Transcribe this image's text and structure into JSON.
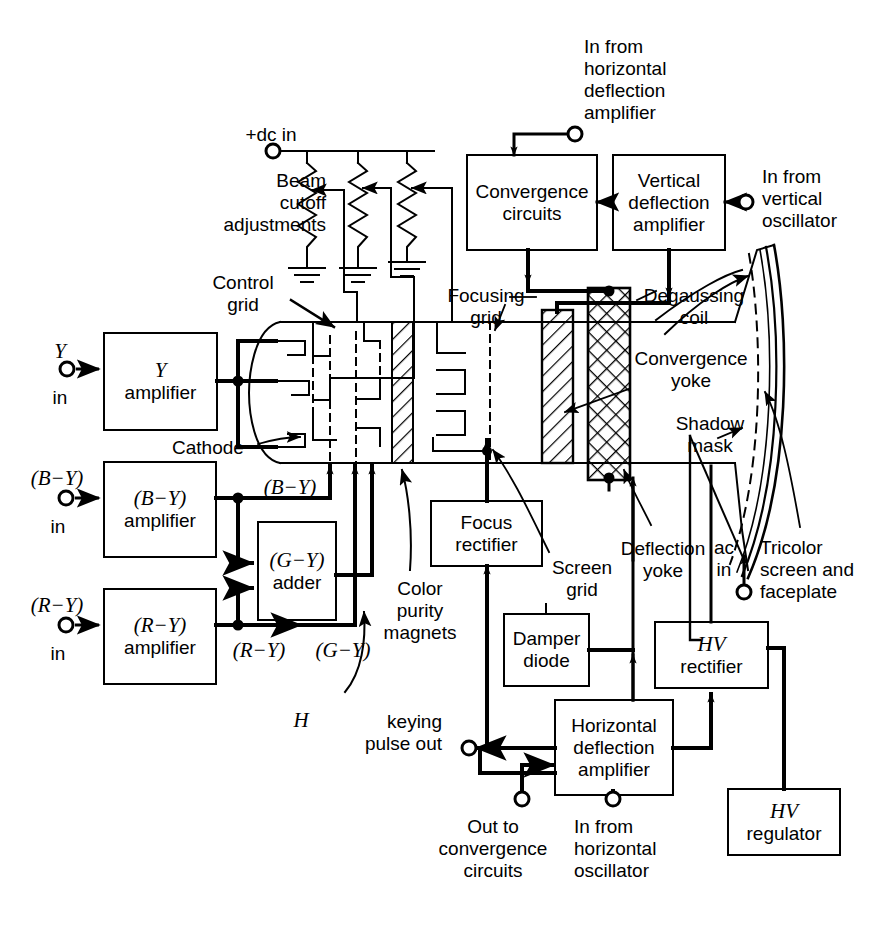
{
  "diagram": {
    "ink": "#000000",
    "paper": "#ffffff"
  },
  "boxes": [
    {
      "id": "y_amp",
      "name": "y-amplifier-box",
      "line1": "Y",
      "line2": "amplifier",
      "italic1": true,
      "x": 104,
      "y": 333,
      "w": 113,
      "h": 97
    },
    {
      "id": "by_amp",
      "name": "b-minus-y-amplifier-box",
      "line1": "(B−Y)",
      "line2": "amplifier",
      "italic1": true,
      "x": 104,
      "y": 462,
      "w": 112,
      "h": 95
    },
    {
      "id": "ry_amp",
      "name": "r-minus-y-amplifier-box",
      "line1": "(R−Y)",
      "line2": "amplifier",
      "italic1": true,
      "x": 104,
      "y": 589,
      "w": 112,
      "h": 95
    },
    {
      "id": "gy_adder",
      "name": "g-minus-y-adder-box",
      "line1": "(G−Y)",
      "line2": "adder",
      "italic1": true,
      "x": 258,
      "y": 522,
      "w": 78,
      "h": 98
    },
    {
      "id": "conv_circ",
      "name": "convergence-circuits-box",
      "line1": "Convergence",
      "line2": "circuits",
      "italic1": false,
      "x": 467,
      "y": 155,
      "w": 130,
      "h": 95
    },
    {
      "id": "vert_defl",
      "name": "vertical-deflection-amplifier-box",
      "line1": "Vertical",
      "line2": "deflection",
      "line3": "amplifier",
      "italic1": false,
      "x": 613,
      "y": 155,
      "w": 112,
      "h": 95
    },
    {
      "id": "focus_rect",
      "name": "focus-rectifier-box",
      "line1": "Focus",
      "line2": "rectifier",
      "italic1": false,
      "x": 431,
      "y": 501,
      "w": 111,
      "h": 65
    },
    {
      "id": "damper",
      "name": "damper-diode-box",
      "line1": "Damper",
      "line2": "diode",
      "italic1": false,
      "x": 504,
      "y": 614,
      "w": 85,
      "h": 72
    },
    {
      "id": "horiz_defl",
      "name": "horizontal-deflection-amplifier-box",
      "line1": "Horizontal",
      "line2": "deflection",
      "line3": "amplifier",
      "italic1": false,
      "x": 555,
      "y": 700,
      "w": 118,
      "h": 95
    },
    {
      "id": "hv_rect",
      "name": "hv-rectifier-box",
      "line1": "HV",
      "line2": "rectifier",
      "italic1": true,
      "x": 655,
      "y": 622,
      "w": 113,
      "h": 66
    },
    {
      "id": "hv_reg",
      "name": "hv-regulator-box",
      "line1": "HV",
      "line2": "regulator",
      "italic1": true,
      "x": 728,
      "y": 789,
      "w": 112,
      "h": 66
    }
  ],
  "labels": [
    {
      "id": "l_plusdc",
      "name": "plus-dc-in-label",
      "text": "+dc in",
      "x": 216,
      "y": 124,
      "w": 110,
      "align": "center"
    },
    {
      "id": "l_beamcut",
      "name": "beam-cutoff-adjustments-label",
      "text": "Beam\ncutoff\nadjustments",
      "x": 154,
      "y": 170,
      "w": 172,
      "align": "right"
    },
    {
      "id": "l_ctrlgrid",
      "name": "control-grid-label",
      "text": "Control\ngrid",
      "x": 200,
      "y": 272,
      "w": 86,
      "align": "center"
    },
    {
      "id": "l_cathode",
      "name": "cathode-label",
      "text": "Cathode",
      "x": 172,
      "y": 437,
      "w": 82,
      "align": "left"
    },
    {
      "id": "l_yin",
      "name": "y-in-terminal-label",
      "text": "Y",
      "x": 48,
      "y": 340,
      "w": 24,
      "align": "center",
      "italic": true
    },
    {
      "id": "l_yin2",
      "name": "y-in-label",
      "text": "in",
      "x": 48,
      "y": 387,
      "w": 24,
      "align": "center"
    },
    {
      "id": "l_byin",
      "name": "b-minus-y-in-terminal-label",
      "text": "(B−Y)",
      "x": 18,
      "y": 467,
      "w": 80,
      "align": "center",
      "italic": true
    },
    {
      "id": "l_byin2",
      "name": "b-minus-y-in-label",
      "text": "in",
      "x": 46,
      "y": 516,
      "w": 24,
      "align": "center"
    },
    {
      "id": "l_ryin",
      "name": "r-minus-y-in-terminal-label",
      "text": "(R−Y)",
      "x": 18,
      "y": 594,
      "w": 80,
      "align": "center",
      "italic": true
    },
    {
      "id": "l_ryin2",
      "name": "r-minus-y-in-label",
      "text": "in",
      "x": 46,
      "y": 643,
      "w": 24,
      "align": "center"
    },
    {
      "id": "l_bywire",
      "name": "b-minus-y-wire-label",
      "text": "(B−Y)",
      "x": 250,
      "y": 480,
      "w": 80,
      "align": "center",
      "italic": true
    },
    {
      "id": "l_rywire",
      "name": "r-minus-y-wire-label",
      "text": "(R−Y)",
      "x": 219,
      "y": 648,
      "w": 80,
      "align": "center",
      "italic": true
    },
    {
      "id": "l_gywire",
      "name": "g-minus-y-wire-label",
      "text": "(G−Y)",
      "x": 303,
      "y": 648,
      "w": 80,
      "align": "center",
      "italic": true
    },
    {
      "id": "l_colorpur",
      "name": "color-purity-magnets-label",
      "text": "Color\npurity\nmagnets",
      "x": 375,
      "y": 578,
      "w": 90,
      "align": "center"
    },
    {
      "id": "l_infromhoriz",
      "name": "in-from-horizontal-deflection-amplifier-label",
      "text": "In from\nhorizontal\ndeflection\namplifier",
      "x": 584,
      "y": 36,
      "w": 120,
      "align": "left"
    },
    {
      "id": "l_infromvert",
      "name": "in-from-vertical-oscillator-label",
      "text": "In from\nvertical\noscillator",
      "x": 762,
      "y": 166,
      "w": 124,
      "align": "left"
    },
    {
      "id": "l_focgrid",
      "name": "focusing-grid-label",
      "text": "Focusing\ngrid",
      "x": 440,
      "y": 285,
      "w": 90,
      "align": "center"
    },
    {
      "id": "l_degauss",
      "name": "degaussing-coil-label",
      "text": "Degaussing\ncoil",
      "x": 638,
      "y": 285,
      "w": 110,
      "align": "center"
    },
    {
      "id": "l_convyoke",
      "name": "convergence-yoke-label",
      "text": "Convergence\nyoke",
      "x": 629,
      "y": 348,
      "w": 122,
      "align": "center"
    },
    {
      "id": "l_shadow",
      "name": "shadow-mask-label",
      "text": "Shadow\nmask",
      "x": 662,
      "y": 413,
      "w": 96,
      "align": "center"
    },
    {
      "id": "l_tricolor",
      "name": "tricolor-screen-faceplate-label",
      "text": "Tricolor\nscreen and\nfaceplate",
      "x": 760,
      "y": 537,
      "w": 128,
      "align": "left"
    },
    {
      "id": "l_acin",
      "name": "ac-in-terminal-label",
      "text": "ac\nin",
      "x": 711,
      "y": 537,
      "w": 32,
      "align": "center"
    },
    {
      "id": "l_deflyoke",
      "name": "deflection-yoke-label",
      "text": "Deflection\nyoke",
      "x": 615,
      "y": 538,
      "w": 110,
      "align": "center"
    },
    {
      "id": "l_screengrid",
      "name": "screen-grid-label",
      "text": "Screen\ngrid",
      "x": 545,
      "y": 557,
      "w": 78,
      "align": "center"
    },
    {
      "id": "l_hkeying",
      "name": "h-keying-pulse-out-label",
      "text": "keying\npulse out",
      "x": 314,
      "y": 711,
      "w": 128,
      "align": "right"
    },
    {
      "id": "l_hkeying_h",
      "name": "h-keying-italic-h-label",
      "text": "H",
      "x": 292,
      "y": 710,
      "w": 22,
      "align": "center",
      "italic": true
    },
    {
      "id": "l_outtoconv",
      "name": "out-to-convergence-circuits-label",
      "text": "Out to\nconvergence\ncircuits",
      "x": 431,
      "y": 816,
      "w": 124,
      "align": "center"
    },
    {
      "id": "l_infromhosc",
      "name": "in-from-horizontal-oscillator-label",
      "text": "In from\nhorizontal\noscillator",
      "x": 574,
      "y": 816,
      "w": 124,
      "align": "left"
    }
  ],
  "terminals": [
    {
      "name": "plus-dc-in-terminal",
      "cx": 273,
      "cy": 151
    },
    {
      "name": "y-in-terminal",
      "cx": 67,
      "cy": 369
    },
    {
      "name": "b-minus-y-in-terminal",
      "cx": 66,
      "cy": 498
    },
    {
      "name": "r-minus-y-in-terminal",
      "cx": 66,
      "cy": 625
    },
    {
      "name": "in-from-horizontal-deflection-terminal",
      "cx": 575,
      "cy": 134
    },
    {
      "name": "in-from-vertical-oscillator-terminal",
      "cx": 746,
      "cy": 202
    },
    {
      "name": "ac-in-terminal",
      "cx": 744,
      "cy": 592
    },
    {
      "name": "h-keying-pulse-out-terminal",
      "cx": 469,
      "cy": 748
    },
    {
      "name": "out-to-convergence-circuits-terminal",
      "cx": 522,
      "cy": 799
    },
    {
      "name": "in-from-horizontal-oscillator-terminal",
      "cx": 613,
      "cy": 799
    }
  ],
  "components": [
    {
      "name": "beam-cutoff-potentiometer-1",
      "x": 307,
      "y": 163,
      "h": 92
    },
    {
      "name": "beam-cutoff-potentiometer-2",
      "x": 358,
      "y": 163,
      "h": 92
    },
    {
      "name": "beam-cutoff-potentiometer-3",
      "x": 407,
      "y": 163,
      "h": 92
    },
    {
      "name": "deflection-yoke-block",
      "x": 542,
      "y": 310,
      "w": 31,
      "h": 153
    },
    {
      "name": "convergence-yoke-block",
      "x": 588,
      "y": 288,
      "w": 42,
      "h": 192
    }
  ]
}
